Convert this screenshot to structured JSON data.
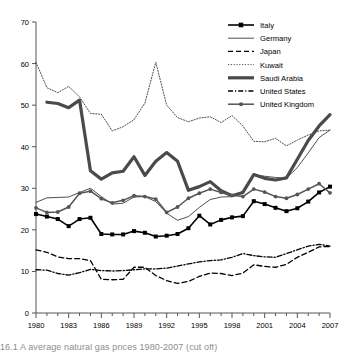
{
  "figure": {
    "caption_partial": "16.1 A  average  natural  gas  prices  1980-2007 (cut off)"
  },
  "chart_data": {
    "type": "line",
    "title": "",
    "subtitle": "",
    "xlabel": "",
    "ylabel": "",
    "xlim": [
      1980,
      2007
    ],
    "ylim": [
      0,
      70
    ],
    "ytick_step": 10,
    "xtick_step": 3,
    "minor_xticks_every": 1,
    "grid": false,
    "legend_position": "top-right",
    "yticks": [
      "0",
      "10",
      "20",
      "30",
      "40",
      "50",
      "60",
      "70"
    ],
    "xticks": [
      "1980",
      "1983",
      "1986",
      "1989",
      "1992",
      "1995",
      "1998",
      "2001",
      "2004",
      "2007"
    ],
    "x": [
      1980,
      1981,
      1982,
      1983,
      1984,
      1985,
      1986,
      1987,
      1988,
      1989,
      1990,
      1991,
      1992,
      1993,
      1994,
      1995,
      1996,
      1997,
      1998,
      1999,
      2000,
      2001,
      2002,
      2003,
      2004,
      2005,
      2006,
      2007
    ],
    "series": [
      {
        "name": "Italy",
        "style": "solid-marker",
        "marker": "square",
        "color": "#000000",
        "width": 1.6,
        "values": [
          23.8,
          23.2,
          22.6,
          20.9,
          22.6,
          22.9,
          19.0,
          18.9,
          18.9,
          19.7,
          19.3,
          18.4,
          18.6,
          19.0,
          20.4,
          23.4,
          21.3,
          22.4,
          23.0,
          23.3,
          26.9,
          26.2,
          25.3,
          24.5,
          25.2,
          26.8,
          29.0,
          30.4
        ]
      },
      {
        "name": "Germany",
        "style": "solid-thin",
        "marker": "none",
        "color": "#3b3b3b",
        "width": 0.9,
        "values": [
          26.6,
          27.7,
          27.8,
          27.9,
          29.0,
          30.0,
          28.0,
          26.2,
          26.4,
          27.9,
          28.0,
          26.8,
          24.0,
          22.3,
          23.2,
          25.4,
          27.3,
          27.9,
          28.0,
          29.3,
          33.3,
          32.9,
          32.6,
          32.4,
          35.0,
          38.5,
          42.2,
          44.0
        ]
      },
      {
        "name": "Japan",
        "style": "dashed",
        "marker": "none",
        "color": "#000000",
        "width": 1.3,
        "values": [
          15.2,
          14.6,
          13.5,
          13.1,
          13.1,
          12.6,
          8.1,
          8.0,
          8.1,
          11.0,
          11.0,
          9.0,
          7.8,
          7.1,
          7.6,
          8.8,
          9.6,
          9.5,
          9.0,
          9.6,
          11.6,
          11.2,
          11.0,
          11.7,
          13.4,
          14.6,
          15.9,
          16.0
        ]
      },
      {
        "name": "Kuwait",
        "style": "dotted",
        "marker": "none",
        "color": "#3b3b3b",
        "width": 0.9,
        "values": [
          60.3,
          54.2,
          53.0,
          54.5,
          52.0,
          48.0,
          47.8,
          43.8,
          44.8,
          46.5,
          50.5,
          60.3,
          50.0,
          47.0,
          46.0,
          46.9,
          47.2,
          45.8,
          47.5,
          45.0,
          41.3,
          41.2,
          42.0,
          40.2,
          41.6,
          42.8,
          43.8,
          44.0
        ]
      },
      {
        "name": "Saudi Arabia",
        "style": "solid-thick",
        "marker": "none",
        "color": "#4a4a4a",
        "width": 3.2,
        "values": [
          null,
          50.7,
          50.4,
          49.4,
          51.2,
          34.2,
          32.2,
          33.7,
          34.1,
          37.6,
          33.1,
          36.5,
          38.6,
          36.5,
          29.5,
          30.4,
          31.6,
          29.4,
          28.2,
          29.0,
          33.3,
          32.4,
          32.0,
          32.5,
          37.0,
          41.5,
          45.0,
          47.7
        ]
      },
      {
        "name": "United States",
        "style": "dash-dot",
        "marker": "none",
        "color": "#000000",
        "width": 1.3,
        "values": [
          10.4,
          10.3,
          9.5,
          9.1,
          9.7,
          10.5,
          10.2,
          10.1,
          10.2,
          10.4,
          10.6,
          10.6,
          10.8,
          11.3,
          11.8,
          12.3,
          12.6,
          12.8,
          13.4,
          14.3,
          13.8,
          13.5,
          13.4,
          14.3,
          15.2,
          16.1,
          16.5,
          16.1
        ]
      },
      {
        "name": "United Kingdom",
        "style": "solid-marker-thin",
        "marker": "circle",
        "color": "#555555",
        "width": 1.5,
        "values": [
          25.3,
          24.2,
          24.3,
          25.5,
          28.8,
          29.3,
          27.5,
          26.5,
          27.1,
          28.2,
          28.0,
          27.4,
          24.2,
          25.5,
          27.6,
          28.8,
          29.8,
          29.0,
          28.3,
          28.0,
          29.8,
          29.1,
          28.0,
          27.6,
          28.5,
          29.8,
          31.1,
          28.9
        ]
      }
    ],
    "legend_entries": [
      "Italy",
      "Germany",
      "Japan",
      "Kuwait",
      "Saudi Arabia",
      "United States",
      "United Kingdom"
    ]
  }
}
